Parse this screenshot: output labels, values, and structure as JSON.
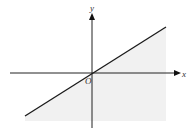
{
  "diagram": {
    "type": "linear-inequality-graph",
    "axis_labels": {
      "x": "x",
      "y": "y",
      "origin": "O"
    },
    "line": {
      "description": "line through origin with positive slope",
      "from": [
        25,
        116
      ],
      "to": [
        166,
        27
      ]
    },
    "shaded_region": "below-right of line",
    "colors": {
      "axis": "#222222",
      "line": "#1a1a1a",
      "shade": "#f1f1f1"
    }
  }
}
